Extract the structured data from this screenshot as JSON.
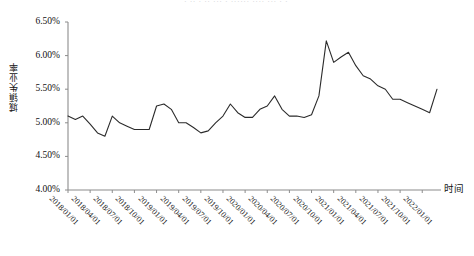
{
  "top_fragment": "·  ·· ·  ·· ···  ·  ······ ···· ··· · ·",
  "chart_data": {
    "type": "line",
    "title": "",
    "xlabel": "时间",
    "ylabel": "城镇失业率",
    "grid": false,
    "legend": "none",
    "line_color": "#2b2b2b",
    "axis_color": "#8c8c8c",
    "background": "#ffffff",
    "ylim": [
      4.0,
      6.5
    ],
    "ytick_labels": [
      "6.50%",
      "6.00%",
      "5.50%",
      "5.00%",
      "4.50%",
      "4.00%"
    ],
    "ytick_values": [
      6.5,
      6.0,
      5.5,
      5.0,
      4.5,
      4.0
    ],
    "xtick_labels": [
      "2018/01/01",
      "2018/04/01",
      "2018/07/01",
      "2018/10/01",
      "2019/01/01",
      "2019/04/01",
      "2019/07/01",
      "2019/10/01",
      "2020/01/01",
      "2020/04/01",
      "2020/07/01",
      "2020/10/01",
      "2021/01/01",
      "2021/04/01",
      "2021/07/01",
      "2021/10/01",
      "2022/01/01"
    ],
    "x": [
      "2018/01",
      "2018/02",
      "2018/03",
      "2018/04",
      "2018/05",
      "2018/06",
      "2018/07",
      "2018/08",
      "2018/09",
      "2018/10",
      "2018/11",
      "2018/12",
      "2019/01",
      "2019/02",
      "2019/03",
      "2019/04",
      "2019/05",
      "2019/06",
      "2019/07",
      "2019/08",
      "2019/09",
      "2019/10",
      "2019/11",
      "2019/12",
      "2020/01",
      "2020/02",
      "2020/03",
      "2020/04",
      "2020/05",
      "2020/06",
      "2020/07",
      "2020/08",
      "2020/09",
      "2020/10",
      "2020/11",
      "2020/12",
      "2021/01",
      "2021/02",
      "2021/03",
      "2021/04",
      "2021/05",
      "2021/06",
      "2021/07",
      "2021/08",
      "2021/09",
      "2021/10",
      "2021/11",
      "2021/12",
      "2022/01",
      "2022/02",
      "2022/03"
    ],
    "values": [
      5.1,
      5.05,
      5.1,
      4.98,
      4.85,
      4.8,
      5.1,
      5.0,
      4.95,
      4.9,
      4.9,
      4.9,
      5.25,
      5.28,
      5.2,
      5.0,
      5.0,
      4.93,
      4.85,
      4.88,
      5.0,
      5.1,
      5.28,
      5.15,
      5.08,
      5.08,
      5.2,
      5.25,
      5.4,
      5.2,
      5.1,
      5.1,
      5.08,
      5.12,
      5.4,
      6.22,
      5.9,
      5.98,
      6.05,
      5.85,
      5.7,
      5.65,
      5.55,
      5.5,
      5.35,
      5.35,
      5.3,
      5.25,
      5.2,
      5.15,
      5.5
    ],
    "series_note": "urban surveyed unemployment rate, monthly, percent"
  }
}
